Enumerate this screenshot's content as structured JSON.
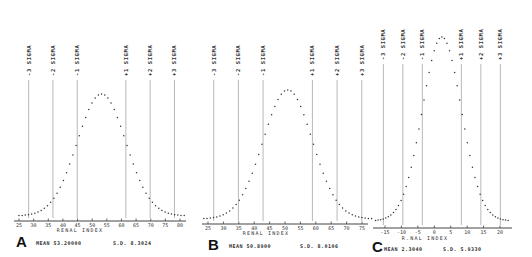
{
  "chart_data": [
    {
      "type": "scatter",
      "panel": "A",
      "title": "",
      "xlabel": "RENAL INDEX",
      "ylabel": "",
      "ticks": [
        25,
        30,
        35,
        40,
        45,
        50,
        55,
        60,
        65,
        70,
        75,
        80
      ],
      "xlim": [
        24,
        82
      ],
      "mean_label": "MEAN 53.20000",
      "sd_label": "S.D. 8.3024",
      "mean": 53.2,
      "sd": 8.3024,
      "sigma_lines": [
        {
          "label": "-3 SIGMA",
          "value": 28.29
        },
        {
          "label": "-2 SIGMA",
          "value": 36.59
        },
        {
          "label": "-1 SIGMA",
          "value": 44.9
        },
        {
          "label": "+1 SIGMA",
          "value": 61.5
        },
        {
          "label": "+2 SIGMA",
          "value": 69.8
        },
        {
          "label": "+3 SIGMA",
          "value": 78.11
        }
      ],
      "curve": "normal distribution dotted curve",
      "grid": false
    },
    {
      "type": "scatter",
      "panel": "B",
      "title": "",
      "xlabel": "RENAL INDEX",
      "ylabel": "",
      "ticks": [
        25,
        30,
        35,
        40,
        45,
        50,
        55,
        60,
        65,
        70,
        75
      ],
      "xlim": [
        22,
        77
      ],
      "mean_label": "MEAN 50.8900",
      "sd_label": "S.D. 8.0106",
      "mean": 50.89,
      "sd": 8.0106,
      "sigma_lines": [
        {
          "label": "-3 SIGMA",
          "value": 26.86
        },
        {
          "label": "-2 SIGMA",
          "value": 34.87
        },
        {
          "label": "-1 SIGMA",
          "value": 42.88
        },
        {
          "label": "+1 SIGMA",
          "value": 58.9
        },
        {
          "label": "+2 SIGMA",
          "value": 66.91
        },
        {
          "label": "+3 SIGMA",
          "value": 74.92
        }
      ],
      "curve": "normal distribution dotted curve",
      "grid": false
    },
    {
      "type": "scatter",
      "panel": "C",
      "title": "",
      "xlabel": "RENAL INDEX",
      "ylabel": "",
      "ticks": [
        -15,
        -10,
        -5,
        0,
        5,
        10,
        15,
        20
      ],
      "xlim": [
        -17,
        26
      ],
      "mean_label": "MEAN 2.3040",
      "sd_label": "S.D. 5.9330",
      "mean": 2.304,
      "sd": 5.933,
      "sigma_lines": [
        {
          "label": "-3 SIGMA",
          "value": -15.49
        },
        {
          "label": "-2 SIGMA",
          "value": -9.56
        },
        {
          "label": "-1 SIGMA",
          "value": -3.63
        },
        {
          "label": "+1 SIGMA",
          "value": 8.24
        },
        {
          "label": "+2 SIGMA",
          "value": 14.17
        },
        {
          "label": "+3 SIGMA",
          "value": 20.1
        }
      ],
      "curve": "normal distribution dotted curve",
      "grid": false
    }
  ],
  "panels": [
    {
      "letter": "A",
      "axis_title": "RENAL  INDEX",
      "mean": "MEAN 53.20000",
      "sd": "S.D. 8.3024"
    },
    {
      "letter": "B",
      "axis_title": "RENAL  INDEX",
      "mean": "MEAN 50.8900",
      "sd": "S.D. 8.0106"
    },
    {
      "letter": "C",
      "axis_title": "R.NAL INDEX",
      "mean": "MEAN 2.3040",
      "sd": "S.D. 5.9330"
    }
  ]
}
